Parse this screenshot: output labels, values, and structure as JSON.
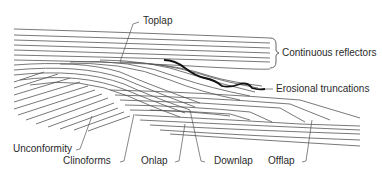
{
  "diagram": {
    "type": "seismic stratigraphy reflection terminations",
    "labels": {
      "toplap": "Toplap",
      "continuous_reflectors": "Continuous reflectors",
      "erosional_truncations": "Erosional truncations",
      "unconformity": "Unconformity",
      "clinoforms": "Clinoforms",
      "onlap": "Onlap",
      "downlap": "Downlap",
      "offlap": "Offlap"
    },
    "colors": {
      "line": "#555555",
      "truncation": "#111111",
      "text": "#2a2a2a",
      "background": "#ffffff"
    }
  }
}
